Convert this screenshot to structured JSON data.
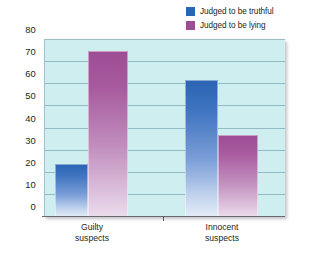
{
  "chart_data": {
    "type": "bar",
    "title": "",
    "subtitle": "",
    "xlabel": "",
    "ylabel": "",
    "categories": [
      "Guilty suspects",
      "Innocent suspects"
    ],
    "category_lines": [
      [
        "Guilty",
        "suspects"
      ],
      [
        "Innocent",
        "suspects"
      ]
    ],
    "series": [
      {
        "name": "Judged to be truthful",
        "values": [
          24,
          62
        ],
        "color": "#2a64b4"
      },
      {
        "name": "Judged to be lying",
        "values": [
          75,
          37
        ],
        "color": "#9c4d95"
      }
    ],
    "ylim": [
      0,
      80
    ],
    "yticks": [
      80,
      70,
      60,
      50,
      40,
      30,
      20,
      10,
      0
    ],
    "ytick_labels": [
      "80",
      "70",
      "60",
      "50",
      "40",
      "30",
      "20",
      "10",
      "0"
    ],
    "grid": true,
    "legend_position": "top-right",
    "plot_background": "#cfeef0",
    "gridline_color": "#7fa9b4"
  },
  "legend": {
    "items": [
      {
        "label": "Judged to be truthful",
        "color": "#2a64b4"
      },
      {
        "label": "Judged to be lying",
        "color": "#9c4d95"
      }
    ]
  }
}
